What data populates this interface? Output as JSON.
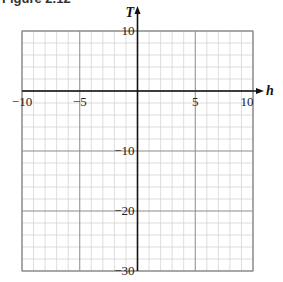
{
  "caption": "Figure 2.12",
  "chart_data": {
    "type": "scatter",
    "title": "",
    "xlabel": "h",
    "ylabel": "T",
    "xlim": [
      -10,
      10
    ],
    "ylim": [
      -30,
      10
    ],
    "x_ticks": [
      -10,
      -5,
      5,
      10
    ],
    "y_ticks": [
      10,
      -10,
      -20,
      -30
    ],
    "x_tick_labels": [
      "−10",
      "−5",
      "5",
      "10"
    ],
    "y_tick_labels": [
      "10",
      "−10",
      "−20",
      "−30"
    ],
    "grid": true,
    "minor_grid_x_step": 1,
    "minor_grid_y_step": 2,
    "major_grid_x_step": 5,
    "major_grid_y_step": 10,
    "series": [],
    "legend": null
  },
  "colors": {
    "minor_grid": "#d4d4d4",
    "major_grid": "#8a8a8a",
    "axis": "#111111"
  }
}
